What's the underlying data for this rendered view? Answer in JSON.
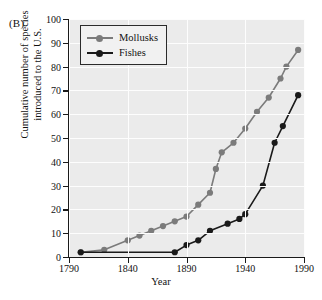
{
  "figure": {
    "panel_label": "(B)",
    "xlabel": "Year",
    "ylabel_line1": "Cumulative number of species",
    "ylabel_line2": "introduced to the U.S."
  },
  "legend": {
    "position": "top-left-inside",
    "entries": [
      {
        "label": "Mollusks",
        "color": "#7b7b7b",
        "marker": "circle"
      },
      {
        "label": "Fishes",
        "color": "#1a1a1a",
        "marker": "circle"
      }
    ]
  },
  "colors": {
    "plot_background": "#ebebeb",
    "gridline": "#fdfdfd",
    "axis": "#1a1a1a",
    "mollusks": "#7b7b7b",
    "fishes": "#1a1a1a",
    "page_background": "#ffffff"
  },
  "axes": {
    "x_ticks": [
      "1790",
      "1840",
      "1890",
      "1940",
      "1990"
    ],
    "x_tick_values": [
      1790,
      1840,
      1890,
      1940,
      1990
    ],
    "y_ticks": [
      "0",
      "10",
      "20",
      "30",
      "40",
      "50",
      "60",
      "70",
      "80",
      "90",
      "100"
    ],
    "y_tick_values": [
      0,
      10,
      20,
      30,
      40,
      50,
      60,
      70,
      80,
      90,
      100
    ],
    "xlim": [
      1790,
      1990
    ],
    "ylim": [
      0,
      100
    ],
    "grid": true
  },
  "chart_data": {
    "type": "line",
    "title": "",
    "subtitle": "",
    "panel_label": "(B)",
    "xlabel": "Year",
    "ylabel": "Cumulative number of species introduced to the U.S.",
    "xlim": [
      1790,
      1990
    ],
    "ylim": [
      0,
      100
    ],
    "x_ticks": [
      1790,
      1840,
      1890,
      1940,
      1990
    ],
    "y_ticks": [
      0,
      10,
      20,
      30,
      40,
      50,
      60,
      70,
      80,
      90,
      100
    ],
    "grid": true,
    "legend_position": "upper left",
    "series": [
      {
        "name": "Mollusks",
        "color": "#7b7b7b",
        "marker": "circle",
        "points": [
          {
            "x": 1800,
            "y": 2
          },
          {
            "x": 1820,
            "y": 3
          },
          {
            "x": 1840,
            "y": 7
          },
          {
            "x": 1850,
            "y": 9
          },
          {
            "x": 1860,
            "y": 11
          },
          {
            "x": 1870,
            "y": 13
          },
          {
            "x": 1880,
            "y": 15
          },
          {
            "x": 1890,
            "y": 17
          },
          {
            "x": 1900,
            "y": 22
          },
          {
            "x": 1910,
            "y": 27
          },
          {
            "x": 1915,
            "y": 37
          },
          {
            "x": 1920,
            "y": 44
          },
          {
            "x": 1930,
            "y": 48
          },
          {
            "x": 1940,
            "y": 54
          },
          {
            "x": 1950,
            "y": 61
          },
          {
            "x": 1960,
            "y": 67
          },
          {
            "x": 1970,
            "y": 75
          },
          {
            "x": 1975,
            "y": 80
          },
          {
            "x": 1985,
            "y": 87
          }
        ]
      },
      {
        "name": "Fishes",
        "color": "#1a1a1a",
        "marker": "circle",
        "points": [
          {
            "x": 1800,
            "y": 2
          },
          {
            "x": 1880,
            "y": 2
          },
          {
            "x": 1890,
            "y": 5
          },
          {
            "x": 1900,
            "y": 7
          },
          {
            "x": 1910,
            "y": 11
          },
          {
            "x": 1925,
            "y": 14
          },
          {
            "x": 1935,
            "y": 16
          },
          {
            "x": 1940,
            "y": 18
          },
          {
            "x": 1955,
            "y": 30
          },
          {
            "x": 1965,
            "y": 48
          },
          {
            "x": 1972,
            "y": 55
          },
          {
            "x": 1985,
            "y": 68
          }
        ]
      }
    ]
  }
}
